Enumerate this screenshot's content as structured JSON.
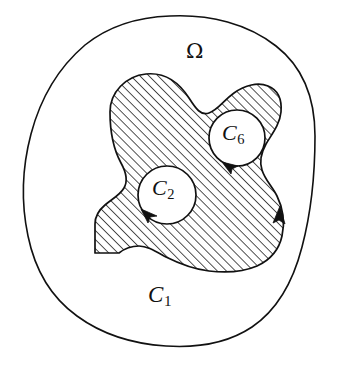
{
  "figure": {
    "type": "mathematical-diagram",
    "background_color": "#ffffff",
    "stroke_color": "#111111",
    "hatch_color": "#1a1a1a",
    "canvas": {
      "width": 340,
      "height": 368
    }
  },
  "labels": {
    "omega": "Ω",
    "outer_curve": {
      "symbol": "C",
      "subscript": "1"
    },
    "hole_left": {
      "symbol": "C",
      "subscript": "2"
    },
    "hole_right": {
      "symbol": "C",
      "subscript": "6"
    }
  },
  "regions": {
    "outer_domain": {
      "name": "Ω",
      "boundary_label": "C1",
      "filled": false,
      "orientation": "none"
    },
    "shaded_region": {
      "fill": "diagonal-hatching",
      "hatch_angle_deg": 45,
      "hatch_spacing_px": 4.5,
      "boundary_arrow_direction": "counterclockwise-up-on-right-edge"
    },
    "holes": [
      {
        "label": "C2",
        "cx": 167,
        "cy": 195,
        "r": 29,
        "arrow": "counterclockwise",
        "arrow_position": "bottom-left"
      },
      {
        "label": "C6",
        "cx": 237,
        "cy": 138,
        "r": 28,
        "arrow": "clockwise",
        "arrow_position": "bottom"
      }
    ]
  },
  "annotations": {
    "arrows": [
      {
        "name": "outer-region-arrow",
        "points": "up",
        "x": 280,
        "y": 218
      },
      {
        "name": "c6-arrow",
        "points": "left",
        "x": 226,
        "y": 166
      },
      {
        "name": "c2-arrow",
        "points": "down-left",
        "x": 146,
        "y": 211
      }
    ]
  }
}
